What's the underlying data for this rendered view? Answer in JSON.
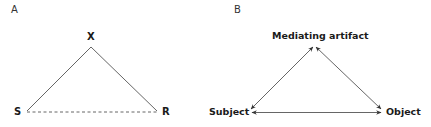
{
  "panels": [
    {
      "letter": "A",
      "nodes": {
        "top": "X",
        "left": "S",
        "right": "R"
      },
      "edges": [
        {
          "from": "S",
          "to": "X",
          "style": "solid"
        },
        {
          "from": "X",
          "to": "R",
          "style": "solid"
        },
        {
          "from": "S",
          "to": "R",
          "style": "dashed"
        }
      ]
    },
    {
      "letter": "B",
      "nodes": {
        "top": "Mediating artifact",
        "left": "Subject",
        "right": "Object"
      },
      "edges": [
        {
          "from": "Subject",
          "to": "Mediating artifact",
          "style": "double-arrow"
        },
        {
          "from": "Mediating artifact",
          "to": "Object",
          "style": "double-arrow"
        },
        {
          "from": "Subject",
          "to": "Object",
          "style": "double-arrow"
        }
      ]
    }
  ],
  "colors": {
    "line": "#444444",
    "text": "#1a1a1a"
  }
}
